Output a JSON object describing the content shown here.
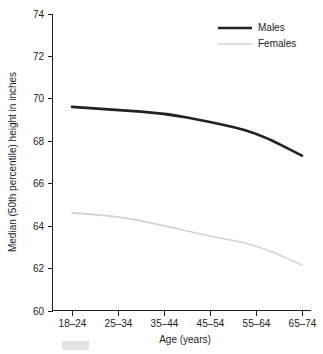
{
  "chart_data": {
    "type": "line",
    "title": "",
    "xlabel": "Age (years)",
    "ylabel": "Median (50th percentile) height in inches",
    "categories": [
      "18–24",
      "25–34",
      "35–44",
      "45–54",
      "55–64",
      "65–74"
    ],
    "ylim": [
      60,
      74
    ],
    "yticks": [
      60,
      62,
      64,
      66,
      68,
      70,
      72,
      74
    ],
    "ytick_labels": [
      "60",
      "62",
      "64",
      "66",
      "68",
      "70",
      "72",
      "74"
    ],
    "grid": false,
    "legend_position": "top-right",
    "series": [
      {
        "name": "Males",
        "color": "#222222",
        "line_width": 2.6,
        "values": [
          69.6,
          69.45,
          69.3,
          68.9,
          68.4,
          67.3
        ]
      },
      {
        "name": "Females",
        "color": "#d2d2d2",
        "line_width": 1.6,
        "values": [
          64.6,
          64.45,
          64.0,
          63.5,
          63.1,
          62.15
        ]
      }
    ]
  },
  "legend": {
    "entries": [
      {
        "label": "Males"
      },
      {
        "label": "Females"
      }
    ]
  },
  "axes": {
    "x_label": "Age (years)",
    "y_label": "Median (50th percentile) height in inches"
  }
}
